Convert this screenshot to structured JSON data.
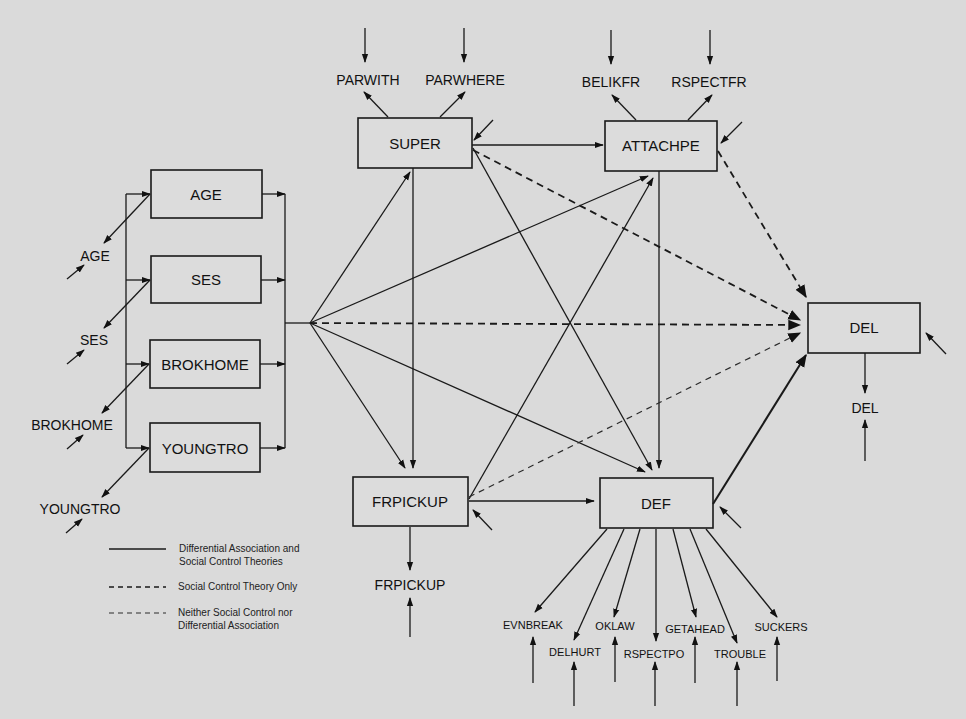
{
  "diagram": {
    "type": "path-model",
    "nodes": {
      "age": {
        "label": "AGE",
        "x": 151,
        "y": 170,
        "w": 111,
        "h": 48
      },
      "ses": {
        "label": "SES",
        "x": 151,
        "y": 256,
        "w": 110,
        "h": 47
      },
      "brokhome": {
        "label": "BROKHOME",
        "x": 150,
        "y": 340,
        "w": 110,
        "h": 48
      },
      "youngtro": {
        "label": "YOUNGTRO",
        "x": 150,
        "y": 423,
        "w": 110,
        "h": 49
      },
      "super": {
        "label": "SUPER",
        "x": 358,
        "y": 118,
        "w": 114,
        "h": 50
      },
      "attachpe": {
        "label": "ATTACHPE",
        "x": 605,
        "y": 121,
        "w": 112,
        "h": 50
      },
      "frpickup": {
        "label": "FRPICKUP",
        "x": 353,
        "y": 477,
        "w": 115,
        "h": 49
      },
      "def": {
        "label": "DEF",
        "x": 600,
        "y": 478,
        "w": 113,
        "h": 50
      },
      "del": {
        "label": "DEL",
        "x": 808,
        "y": 303,
        "w": 112,
        "h": 50
      }
    },
    "indicators": {
      "age": "AGE",
      "ses": "SES",
      "brokhome": "BROKHOME",
      "youngtro": "YOUNGTRO",
      "parwith": "PARWITH",
      "parwhere": "PARWHERE",
      "belikfr": "BELIKFR",
      "rspectfr": "RSPECTFR",
      "frpickup": "FRPICKUP",
      "del": "DEL",
      "evnbreak": "EVNBREAK",
      "delhurt": "DELHURT",
      "oklaw": "OKLAW",
      "rspectpo": "RSPECTPO",
      "getahead": "GETAHEAD",
      "trouble": "TROUBLE",
      "suckers": "SUCKERS"
    },
    "edges": [
      {
        "from": "exogenous",
        "to": "super",
        "style": "solid"
      },
      {
        "from": "exogenous",
        "to": "attachpe",
        "style": "solid"
      },
      {
        "from": "exogenous",
        "to": "del",
        "style": "social-control-only"
      },
      {
        "from": "exogenous",
        "to": "def",
        "style": "solid"
      },
      {
        "from": "exogenous",
        "to": "frpickup",
        "style": "solid"
      },
      {
        "from": "super",
        "to": "attachpe",
        "style": "solid"
      },
      {
        "from": "super",
        "to": "frpickup",
        "style": "solid"
      },
      {
        "from": "super",
        "to": "def",
        "style": "solid"
      },
      {
        "from": "super",
        "to": "del",
        "style": "social-control-only"
      },
      {
        "from": "attachpe",
        "to": "def",
        "style": "solid"
      },
      {
        "from": "attachpe",
        "to": "del",
        "style": "social-control-only"
      },
      {
        "from": "frpickup",
        "to": "attachpe",
        "style": "solid"
      },
      {
        "from": "frpickup",
        "to": "def",
        "style": "solid"
      },
      {
        "from": "frpickup",
        "to": "del",
        "style": "neither"
      },
      {
        "from": "def",
        "to": "del",
        "style": "solid"
      }
    ]
  },
  "legend": {
    "items": [
      {
        "style": "solid",
        "line1": "Differential Association and",
        "line2": "Social Control Theories"
      },
      {
        "style": "social-control-only",
        "line1": "Social Control Theory Only",
        "line2": ""
      },
      {
        "style": "neither",
        "line1": "Neither Social Control nor",
        "line2": "Differential Association"
      }
    ]
  }
}
